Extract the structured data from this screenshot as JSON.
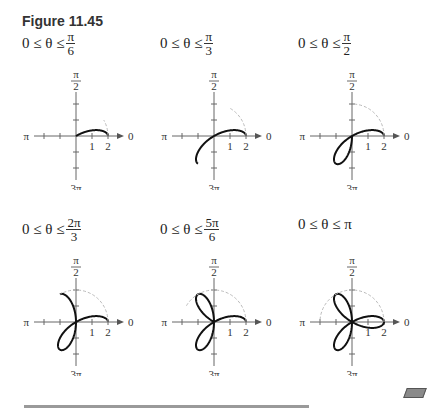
{
  "figure": {
    "title": "Figure 11.45",
    "curve": "r = 2cos(3θ)",
    "axis_labels": {
      "top_num": "π",
      "top_den": "2",
      "bottom_num": "3π",
      "bottom_den": "2",
      "left": "π",
      "right": "0",
      "tick1": "1",
      "tick2": "2"
    },
    "panels": [
      {
        "label_prefix": "0 ≤ θ ≤ ",
        "frac_num": "π",
        "frac_den": "6",
        "theta_max_over_pi": 0.1667
      },
      {
        "label_prefix": "0 ≤ θ ≤ ",
        "frac_num": "π",
        "frac_den": "3",
        "theta_max_over_pi": 0.3333
      },
      {
        "label_prefix": "0 ≤ θ ≤ ",
        "frac_num": "π",
        "frac_den": "2",
        "theta_max_over_pi": 0.5
      },
      {
        "label_prefix": "0 ≤ θ ≤ ",
        "frac_num": "2π",
        "frac_den": "3",
        "theta_max_over_pi": 0.6667
      },
      {
        "label_prefix": "0 ≤ θ ≤ ",
        "frac_num": "5π",
        "frac_den": "6",
        "theta_max_over_pi": 0.8333
      },
      {
        "label_prefix": "0 ≤ θ ≤ π",
        "frac_num": "",
        "frac_den": "",
        "theta_max_over_pi": 1.0
      }
    ]
  },
  "chart_data": {
    "type": "line",
    "title": "Figure 11.45",
    "function": "r = 2cos(3θ)",
    "coordinate_system": "polar",
    "r_ticks": [
      1,
      2
    ],
    "angle_labels": [
      "0",
      "π/2",
      "π",
      "3π/2"
    ],
    "panels": [
      {
        "range": "0 ≤ θ ≤ π/6",
        "theta_max": 0.5236
      },
      {
        "range": "0 ≤ θ ≤ π/3",
        "theta_max": 1.0472
      },
      {
        "range": "0 ≤ θ ≤ π/2",
        "theta_max": 1.5708
      },
      {
        "range": "0 ≤ θ ≤ 2π/3",
        "theta_max": 2.0944
      },
      {
        "range": "0 ≤ θ ≤ 5π/6",
        "theta_max": 2.618
      },
      {
        "range": "0 ≤ θ ≤ π",
        "theta_max": 3.1416
      }
    ]
  }
}
